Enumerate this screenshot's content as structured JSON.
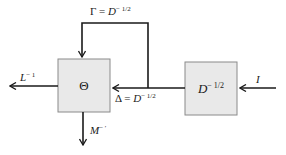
{
  "diagram": {
    "colors": {
      "line": "#1a1a1a",
      "box_fill": "#e9e9e9",
      "box_border": "#8a8a8a"
    },
    "nodes": [
      {
        "id": "theta",
        "label": "Θ"
      },
      {
        "id": "d",
        "label_base": "D",
        "label_exp": "− 1/2"
      }
    ],
    "edges": {
      "input": {
        "label_base": "I"
      },
      "delta": {
        "label_pre": "Δ = ",
        "label_base": "D",
        "label_exp": "− 1/2"
      },
      "gamma": {
        "label_pre": "Γ = ",
        "label_base": "D",
        "label_exp": "− 1/2"
      },
      "l_out": {
        "label_base": "L",
        "label_exp": "− 1"
      },
      "m_out": {
        "label_base": "M",
        "label_exp": "− ′"
      }
    }
  }
}
